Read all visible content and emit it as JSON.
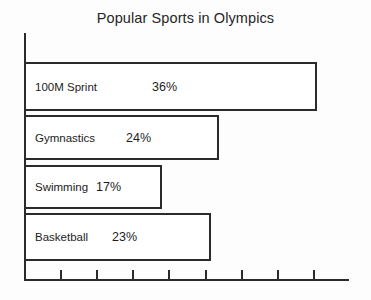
{
  "chart_data": {
    "type": "bar",
    "orientation": "horizontal",
    "title": "Popular Sports in Olympics",
    "xlabel": "",
    "ylabel": "",
    "categories": [
      "100M Sprint",
      "Gymnastics",
      "Swimming",
      "Basketball"
    ],
    "values": [
      36,
      24,
      17,
      23
    ],
    "value_labels": [
      "36%",
      "24%",
      "17%",
      "23%"
    ],
    "unit": "%",
    "xlim": [
      0,
      40
    ],
    "x_tick_count": 8,
    "x_tick_labels": [],
    "grid": false,
    "legend": null,
    "bar_fill_color": "#ffffff",
    "bar_border_color": "#2b2b2b",
    "axis_color": "#2b2b2b",
    "background_color": "#fdfdfd",
    "bars": [
      {
        "label": "100M Sprint",
        "value": 36,
        "value_label": "36%"
      },
      {
        "label": "Gymnastics",
        "value": 24,
        "value_label": "24%"
      },
      {
        "label": "Swimming",
        "value": 17,
        "value_label": "17%"
      },
      {
        "label": "Basketball",
        "value": 23,
        "value_label": "23%"
      }
    ]
  }
}
